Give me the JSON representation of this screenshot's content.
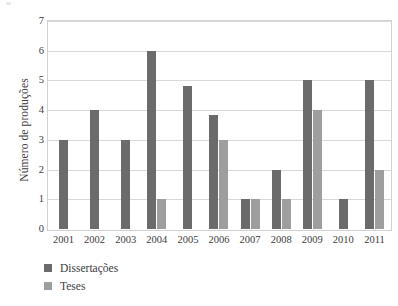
{
  "chart_data": {
    "type": "bar",
    "title": "",
    "xlabel": "",
    "ylabel": "Número de produções",
    "categories": [
      "2001",
      "2002",
      "2003",
      "2004",
      "2005",
      "2006",
      "2007",
      "2008",
      "2009",
      "2010",
      "2011"
    ],
    "series": [
      {
        "name": "Dissertações",
        "color": "#6b6b6b",
        "values": [
          3,
          4,
          3,
          6,
          4.8,
          3.85,
          1,
          2,
          5,
          1,
          5
        ]
      },
      {
        "name": "Teses",
        "color": "#9e9e9e",
        "values": [
          0,
          0,
          0,
          1,
          0,
          3,
          1,
          1,
          4,
          0,
          2
        ]
      }
    ],
    "ylim": [
      0,
      7
    ],
    "ytick_labels": [
      "0",
      "1",
      "2",
      "3",
      "4",
      "5",
      "6",
      "7"
    ],
    "ytick_values": [
      0,
      1,
      2,
      3,
      4,
      5,
      6,
      7
    ],
    "grid": true,
    "legend_position": "bottom-left",
    "frame_color": "#d2d2d2",
    "gridline_color": "#d8d8d8",
    "background": "#ffffff"
  },
  "legend": {
    "items": [
      {
        "label": "Dissertações",
        "color": "#6b6b6b",
        "swatch_name": "legend-swatch-dissertacoes"
      },
      {
        "label": "Teses",
        "color": "#9e9e9e",
        "swatch_name": "legend-swatch-teses"
      }
    ]
  }
}
